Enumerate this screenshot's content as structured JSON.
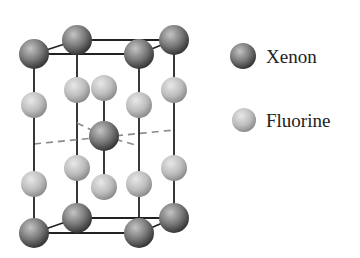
{
  "diagram": {
    "colors": {
      "xenon_light": "#b5b5b5",
      "xenon_dark": "#3a3a3a",
      "fluorine_light": "#e2e2e2",
      "fluorine_dark": "#8c8c8c",
      "bond": "#222222",
      "dashed": "#888888"
    }
  },
  "legend": {
    "items": [
      {
        "label": "Xenon",
        "type": "xenon"
      },
      {
        "label": "Fluorine",
        "type": "fluorine"
      }
    ]
  }
}
